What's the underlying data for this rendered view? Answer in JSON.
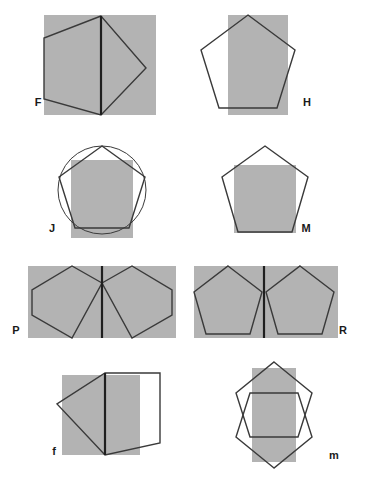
{
  "sheet": {
    "title": "Pentagon and rectangle overlay figures",
    "width": 366,
    "height": 483,
    "background_color": "#ffffff",
    "shape_fill_color": "#b3b3b3",
    "outline_color": "#3a3a3a",
    "heavy_line_color": "#1f1f1f",
    "label_color": "#1a1a1a"
  },
  "figures": [
    {
      "id": "F",
      "label": "F",
      "label_x": 38,
      "label_y": 106,
      "description": "Gray square with a pentagon rotated so one vertex points right, plus a heavy vertical chord",
      "rect": {
        "x": 44,
        "y": 15,
        "width": 112,
        "height": 100
      },
      "pentagon_points": "101,16 44,38 44,99 101,115 146,68",
      "heavy_line": {
        "x1": 101,
        "y1": 16,
        "x2": 101,
        "y2": 115
      }
    },
    {
      "id": "H",
      "label": "H",
      "label_x": 307,
      "label_y": 106,
      "description": "Vertical gray rectangle overlapped by an upright pentagon",
      "rect": {
        "x": 228,
        "y": 15,
        "width": 60,
        "height": 100
      },
      "pentagon_points": "248,15 295,50 277,108 219,108 201,50",
      "heavy_line": null
    },
    {
      "id": "J",
      "label": "J",
      "label_x": 52,
      "label_y": 232,
      "description": "Circle with inscribed pentagon and an overlapping gray rectangle",
      "rect": {
        "x": 71,
        "y": 160,
        "width": 62,
        "height": 78
      },
      "pentagon_points": "102,146 145,177 129,228 75,228 59,177",
      "circle": {
        "cx": 102,
        "cy": 190,
        "r": 44
      },
      "heavy_line": null
    },
    {
      "id": "M",
      "label": "M",
      "label_x": 306,
      "label_y": 232,
      "description": "Upright pentagon containing an inscribed gray square",
      "rect": {
        "x": 234,
        "y": 165,
        "width": 62,
        "height": 68
      },
      "pentagon_points": "265,146 308,177 292,232 238,232 222,177",
      "heavy_line": null
    },
    {
      "id": "P",
      "label": "P",
      "label_x": 16,
      "label_y": 334,
      "description": "Wide gray rectangle with two mirrored pentagons pointing outward joined at a vertical centre line",
      "rect": {
        "x": 28,
        "y": 266,
        "width": 148,
        "height": 72
      },
      "pentagon_points": "102,283 72,266 32,290 32,315 72,338",
      "pentagon2_points": "102,283 132,266 172,290 172,315 132,338",
      "heavy_line": {
        "x1": 102,
        "y1": 266,
        "x2": 102,
        "y2": 338
      }
    },
    {
      "id": "R",
      "label": "R",
      "label_x": 343,
      "label_y": 334,
      "description": "Wide gray rectangle with two upright pentagons side by side separated by a vertical line",
      "rect": {
        "x": 194,
        "y": 266,
        "width": 144,
        "height": 72
      },
      "pentagon_points": "228,266 262,292 250,334 206,334 194,292",
      "pentagon2_points": "300,266 334,292 322,334 278,334 266,292",
      "heavy_line": {
        "x1": 264,
        "y1": 266,
        "x2": 264,
        "y2": 338
      }
    },
    {
      "id": "f",
      "label": "f",
      "label_x": 54,
      "label_y": 455,
      "description": "Gray rectangle with a pentagon pointing left that extends outside to the right",
      "rect": {
        "x": 62,
        "y": 375,
        "width": 78,
        "height": 80
      },
      "pentagon_points": "105,373 160,373 160,443 105,455 57,404",
      "heavy_line": {
        "x1": 105,
        "y1": 373,
        "x2": 105,
        "y2": 455
      }
    },
    {
      "id": "m",
      "label": "m",
      "label_x": 334,
      "label_y": 459,
      "description": "Two overlapping pentagons, one upright and one inverted, over a vertical gray rectangle forming a central diamond",
      "rect": {
        "x": 252,
        "y": 368,
        "width": 44,
        "height": 94
      },
      "pentagon_points": "274,362 312,393 298,437 250,437 236,393",
      "pentagon2_points": "274,468 236,437 250,393 298,393 312,437",
      "heavy_line": null
    }
  ]
}
